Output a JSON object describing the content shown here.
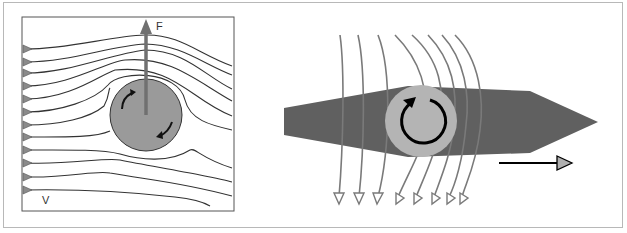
{
  "figure": {
    "left_panel": {
      "title": "Magnus effect on rotating cylinder",
      "force_label": "F",
      "velocity_label": "V",
      "streamline_count": 12,
      "colors": {
        "cylinder": "#9a9a9a",
        "force_arrow": "#707070",
        "streamlines": "#333333",
        "inlet_markers": "#8a8a8a",
        "rotation_arrows": "#111111"
      }
    },
    "right_panel": {
      "title": "Rotor on hull with deflected flow",
      "rotor_direction": "clockwise",
      "flow_line_count": 8,
      "colors": {
        "hull": "#606060",
        "rotor": "#b4b4b4",
        "flow_lines": "#7a7a7a",
        "rotation_arrow": "#000000",
        "motion_arrowhead": "#b0b0b0"
      }
    }
  }
}
